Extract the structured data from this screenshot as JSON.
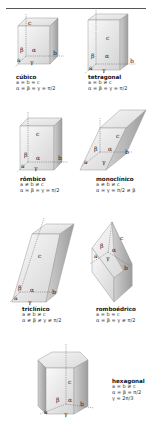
{
  "systems": [
    {
      "name": "cúbico",
      "edges": "a = b = c",
      "angles": "α = β = γ = π/2",
      "angles2": "",
      "labels": {
        "a": "a",
        "b": "b",
        "c": "c",
        "alpha": "α",
        "beta": "β",
        "gamma": "γ"
      }
    },
    {
      "name": "tetragonal",
      "edges": "a = b ≠ c",
      "angles": "α = β = γ = π/2",
      "angles2": "",
      "labels": {
        "a": "a",
        "b": "b",
        "c": "c",
        "alpha": "α",
        "beta": "β",
        "gamma": "γ"
      }
    },
    {
      "name": "rômbico",
      "edges": "a ≠ b ≠ c",
      "angles": "α = β = γ = π/2",
      "angles2": "",
      "labels": {
        "a": "a",
        "b": "b",
        "c": "c",
        "alpha": "α",
        "beta": "β",
        "gamma": "γ"
      }
    },
    {
      "name": "monoclínico",
      "edges": "a ≠ b ≠ c",
      "angles": "α = γ = π/2 ≠ β",
      "angles2": "",
      "labels": {
        "a": "a",
        "b": "b",
        "c": "c",
        "alpha": "α",
        "beta": "β",
        "gamma": "γ"
      }
    },
    {
      "name": "triclínico",
      "edges": "a ≠ b ≠ c",
      "angles": "α ≠ β ≠ γ ≠ π/2",
      "angles2": "",
      "labels": {
        "a": "a",
        "b": "b",
        "c": "c",
        "alpha": "α",
        "beta": "β",
        "gamma": "γ"
      }
    },
    {
      "name": "romboédrico",
      "edges": "a = b = c",
      "angles": "α = β = γ ≠ π/2",
      "angles2": "",
      "labels": {
        "a": "a",
        "b": "b",
        "c": "c",
        "alpha": "α",
        "beta": "β",
        "gamma": "γ"
      }
    },
    {
      "name": "hexagonal",
      "edges": "a = b ≠ c",
      "angles": "α = β = π/2",
      "angles2": "γ = 2π/3",
      "labels": {
        "a": "a",
        "b": "b",
        "c": "c",
        "alpha": "α",
        "beta": "β",
        "gamma": "γ"
      }
    }
  ],
  "colors": {
    "face_light": "#f2f2f2",
    "face_mid": "#d9d9d9",
    "face_dark": "#b5b5b5",
    "edge": "#8a8a8a",
    "axis": "#666666"
  }
}
